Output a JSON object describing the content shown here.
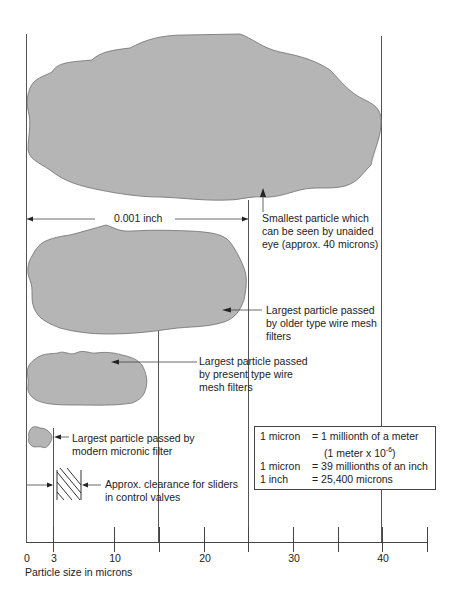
{
  "diagram": {
    "colors": {
      "particle_fill": "#b5b5b5",
      "particle_stroke": "#6e6e6e",
      "line": "#555555"
    },
    "dimension_label": "0.001 inch",
    "particles": [
      {
        "id": "visible-eye",
        "label_lines": [
          "Smallest particle which",
          "can be seen by unaided",
          "eye (approx. 40 microns)"
        ]
      },
      {
        "id": "older-wire-mesh",
        "label_lines": [
          "Largest particle passed",
          "by older type wire mesh",
          "filters"
        ]
      },
      {
        "id": "present-wire-mesh",
        "label_lines": [
          "Largest particle passed",
          "by present type wire",
          "mesh filters"
        ]
      },
      {
        "id": "micronic-filter",
        "label_lines": [
          "Largest particle passed by",
          "modern micronic filter"
        ]
      },
      {
        "id": "slider-clearance",
        "label_lines": [
          "Approx. clearance for sliders",
          "in control valves"
        ]
      }
    ],
    "legend": {
      "rows": [
        {
          "key": "1 micron",
          "value": "= 1 millionth of a meter"
        },
        {
          "key": "",
          "value": "(1 meter x 10",
          "sup": "-6",
          "suffix": ")"
        },
        {
          "key": "1 micron",
          "value": "= 39 millionths of an inch"
        },
        {
          "key": "1 inch",
          "value": "= 25,400 microns"
        }
      ]
    },
    "axis": {
      "title": "Particle size in microns",
      "tick_labels": [
        "0",
        "3",
        "10",
        "20",
        "30",
        "40"
      ],
      "tick_values": [
        0,
        3,
        10,
        20,
        30,
        40
      ]
    }
  }
}
